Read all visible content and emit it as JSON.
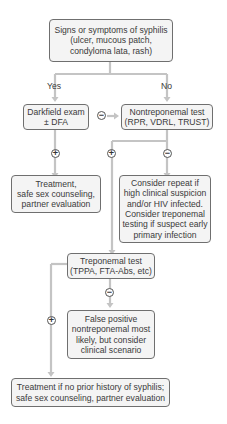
{
  "nodes": {
    "start": {
      "lines": [
        "Signs or symptoms of syphilis",
        "(ulcer, mucous patch,",
        "condyloma lata, rash)"
      ]
    },
    "darkfield": {
      "lines": [
        "Darkfield exam",
        "± DFA"
      ]
    },
    "nontrep": {
      "lines": [
        "Nontreponemal test",
        "(RPR, VDRL, TRUST)"
      ]
    },
    "treatment1": {
      "lines": [
        "Treatment,",
        "safe sex counseling,",
        "partner evaluation"
      ]
    },
    "consider": {
      "lines": [
        "Consider repeat if",
        "high clinical suspicion",
        "and/or HIV infected.",
        "Consider treponemal",
        "testing if suspect early",
        "primary infection"
      ]
    },
    "trep": {
      "lines": [
        "Treponemal test",
        "(TPPA, FTA-Abs, etc)"
      ]
    },
    "falsepos": {
      "lines": [
        "False positive",
        "nontreponemal most",
        "likely, but consider",
        "clinical scenario"
      ]
    },
    "treatment2": {
      "lines": [
        "Treatment if no prior history of syphilis;",
        "safe sex counseling, partner evaluation"
      ]
    }
  },
  "labels": {
    "yes": "Yes",
    "no": "No"
  },
  "symbols": {
    "plus": "+",
    "minus": "−"
  },
  "colors": {
    "line": "#bdbdbd",
    "box_border": "#6f6f6f",
    "box_fill": "#f4f4f4",
    "text": "#3a3a3a"
  }
}
